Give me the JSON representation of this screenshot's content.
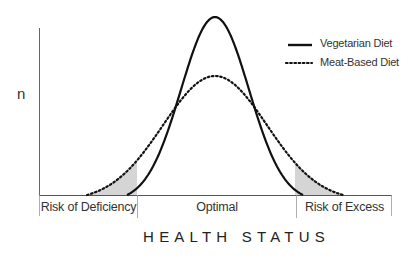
{
  "chart_data": {
    "type": "line",
    "title": "",
    "xlabel": "HEALTH STATUS",
    "ylabel": "n",
    "grid": false,
    "legend_position": "top-right",
    "series": [
      {
        "name": "Vegetarian Diet",
        "style": "solid",
        "shape": "normal distribution (narrow, tall)",
        "relative_peak": 1.0,
        "x_range_fraction": [
          0.25,
          0.75
        ]
      },
      {
        "name": "Meat-Based Diet",
        "style": "dotted",
        "shape": "normal distribution (wide, short)",
        "relative_peak": 0.67,
        "x_range_fraction": [
          0.14,
          0.86
        ]
      }
    ],
    "zones": [
      "Risk of Deficiency",
      "Optimal",
      "Risk of Excess"
    ],
    "annotations": [
      "Shaded (hatched) tails of Meat-Based Diet curve fall into Risk of Deficiency and Risk of Excess zones"
    ]
  },
  "labels": {
    "y_axis": "n",
    "x_axis": "HEALTH STATUS",
    "legend_solid": "Vegetarian Diet",
    "legend_dotted": "Meat-Based Diet",
    "zone_left": "Risk of Deficiency",
    "zone_middle": "Optimal",
    "zone_right": "Risk of Excess"
  },
  "colors": {
    "line": "#111111",
    "axis": "#555555",
    "hatch": "#888888"
  }
}
